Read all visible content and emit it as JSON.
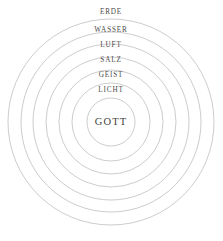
{
  "diagram": {
    "background_color": "#ffffff",
    "stroke_color": "#b6b6b6",
    "label_color": "#4d4a48",
    "center_label_color": "#433f3d",
    "center": {
      "x": 111,
      "y": 122
    },
    "center_label": "GOTT",
    "center_radius": 24,
    "rings": [
      {
        "label": "ERDE",
        "radius": 103,
        "label_x": 111,
        "label_y": 13
      },
      {
        "label": "WASSER",
        "radius": 90,
        "label_x": 111,
        "label_y": 31
      },
      {
        "label": "LUFT",
        "radius": 78,
        "label_x": 111,
        "label_y": 46
      },
      {
        "label": "SALZ",
        "radius": 65,
        "label_x": 111,
        "label_y": 61
      },
      {
        "label": "GEIST",
        "radius": 52,
        "label_x": 111,
        "label_y": 76
      },
      {
        "label": "LICHT",
        "radius": 39,
        "label_x": 111,
        "label_y": 91
      }
    ]
  },
  "chart_data": {
    "type": "diagram",
    "subtype": "concentric-circles",
    "center": {
      "label": "GOTT",
      "radius": 24
    },
    "categories": [
      "GOTT",
      "LICHT",
      "GEIST",
      "SALZ",
      "LUFT",
      "WASSER",
      "ERDE"
    ],
    "radii": [
      24,
      39,
      52,
      65,
      78,
      90,
      103
    ],
    "order": "innermost-to-outermost",
    "legend": "none",
    "grid": false,
    "xlabel": "",
    "ylabel": ""
  }
}
